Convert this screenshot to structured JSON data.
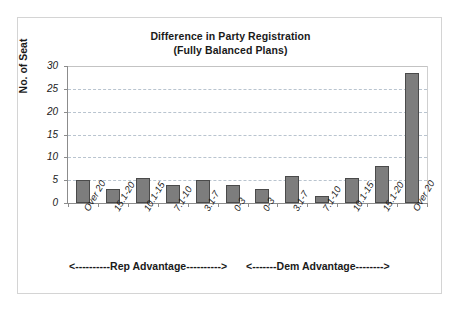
{
  "chart_data": {
    "type": "bar",
    "title": "Difference in Party Registration\n(Fully Balanced Plans)",
    "title_line1": "Difference in Party Registration",
    "title_line2": "(Fully Balanced Plans)",
    "xlabel": "",
    "ylabel": "No. of Seat",
    "ylim": [
      0,
      30
    ],
    "ytick_step": 5,
    "yticks": [
      30,
      25,
      20,
      15,
      10,
      5,
      0
    ],
    "ytick_labels": [
      "30",
      "25",
      "20",
      "15",
      "10",
      "5",
      "0"
    ],
    "grid": true,
    "grid_axis": "y",
    "legend": false,
    "bar_color": "#7d7d7d",
    "bar_edge_color": "#4a4a4a",
    "categories": [
      "Over 20",
      "15.1-20",
      "10.1-15",
      "7.1-10",
      "3.1-7",
      "0-3",
      "0-3",
      "3.1-7",
      "7.1-10",
      "10.1-15",
      "15.1-20",
      "Over 20"
    ],
    "values": [
      5,
      3,
      5.5,
      4,
      5,
      4,
      3,
      6,
      1.5,
      5.5,
      8,
      28.5
    ],
    "annotations": [
      {
        "name": "rep-advantage",
        "text": "<----------Rep Advantage---------->",
        "position": "below-x-axis-left",
        "covers_categories": [
          0,
          5
        ]
      },
      {
        "name": "dem-advantage",
        "text": "<-------Dem Advantage-------->",
        "position": "below-x-axis-right",
        "covers_categories": [
          6,
          11
        ]
      }
    ]
  }
}
